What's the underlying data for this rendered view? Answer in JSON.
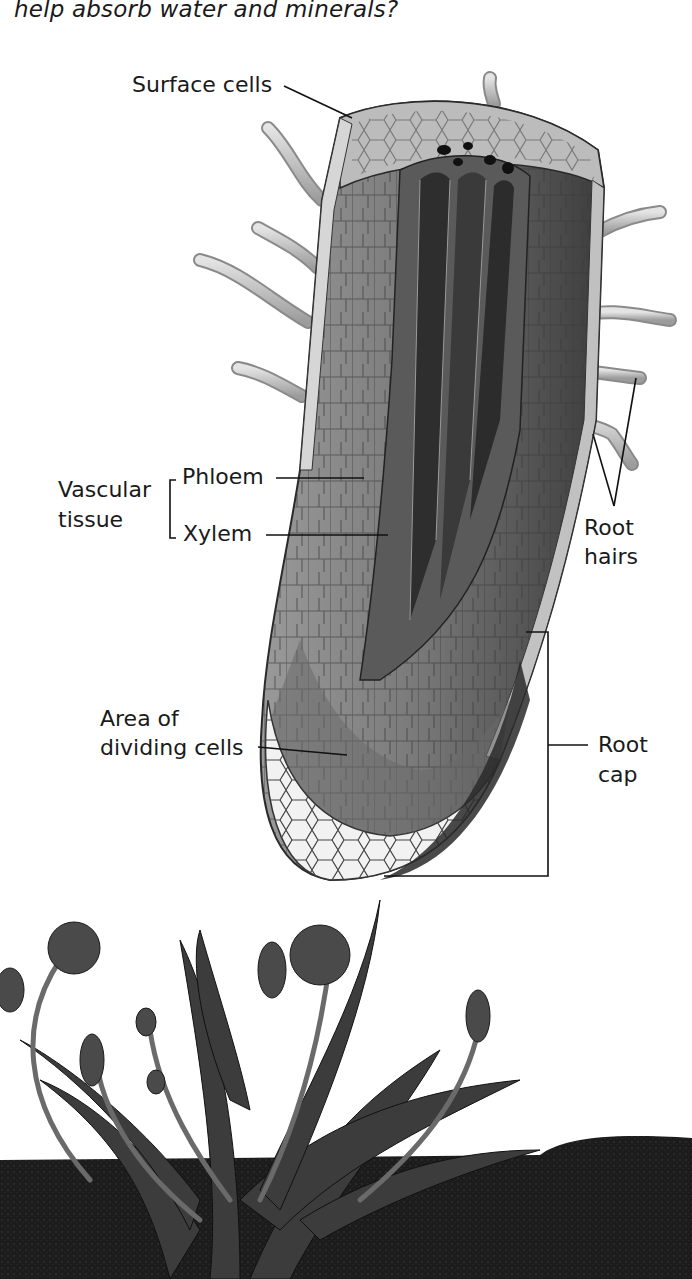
{
  "question": {
    "text": "help absorb water and minerals?"
  },
  "diagram": {
    "labels": {
      "surface_cells": "Surface cells",
      "vascular_tissue_line1": "Vascular",
      "vascular_tissue_line2": "tissue",
      "phloem": "Phloem",
      "xylem": "Xylem",
      "root_hairs_line1": "Root",
      "root_hairs_line2": "hairs",
      "dividing_cells_line1": "Area of",
      "dividing_cells_line2": "dividing cells",
      "root_cap_line1": "Root",
      "root_cap_line2": "cap"
    },
    "colors": {
      "outer_tissue": "#8a8a8a",
      "surface_cells": "#cfcfcf",
      "vascular_dark": "#2e2e2e",
      "root_cap_cells": "#f2f2f2",
      "root_hair": "#c8c8c8",
      "soil": "#1e1e1e",
      "plant": "#3a3a3a"
    }
  },
  "photo": {
    "subject": "dandelion plant in soil"
  }
}
